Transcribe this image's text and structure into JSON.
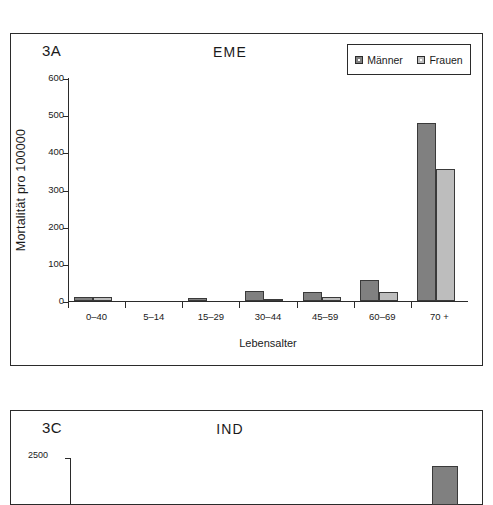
{
  "figure": {
    "panels": [
      {
        "tag": "3A",
        "title": "EME"
      },
      {
        "tag": "3C",
        "title": "IND"
      }
    ]
  },
  "legend": {
    "position": "top-right",
    "entries": [
      {
        "label": "Männer",
        "color": "#808080"
      },
      {
        "label": "Frauen",
        "color": "#bdbdbd"
      }
    ]
  },
  "colors": {
    "maenner": "#808080",
    "frauen": "#bdbdbd",
    "axis": "#2b2b2b",
    "frame": "#2b2b2b",
    "background": "#ffffff"
  },
  "chart_data": {
    "type": "bar",
    "title": "EME",
    "panel_tag": "3A",
    "xlabel": "Lebensalter",
    "ylabel": "Mortalität pro 100000",
    "categories": [
      "0–40",
      "5–14",
      "15–29",
      "30–44",
      "45–59",
      "60–69",
      "70 +"
    ],
    "series": [
      {
        "name": "Männer",
        "color": "#808080",
        "values": [
          10,
          0,
          8,
          26,
          25,
          57,
          478
        ]
      },
      {
        "name": "Frauen",
        "color": "#bdbdbd",
        "values": [
          10,
          0,
          0,
          5,
          10,
          25,
          355
        ]
      }
    ],
    "ylim": [
      0,
      600
    ],
    "yticks": [
      0,
      100,
      200,
      300,
      400,
      500,
      600
    ],
    "ytick_labels": [
      "0",
      "100",
      "200",
      "300",
      "400",
      "500",
      "600"
    ],
    "grid": false,
    "legend_position": "top-right"
  },
  "chart_data_partial": {
    "type": "bar",
    "title": "IND",
    "panel_tag": "3C",
    "ytick_labels": [
      "2500"
    ],
    "note_visible_ylim_top": 2500,
    "visible_bars": [
      {
        "series": "Männer",
        "color": "#808080"
      }
    ]
  }
}
